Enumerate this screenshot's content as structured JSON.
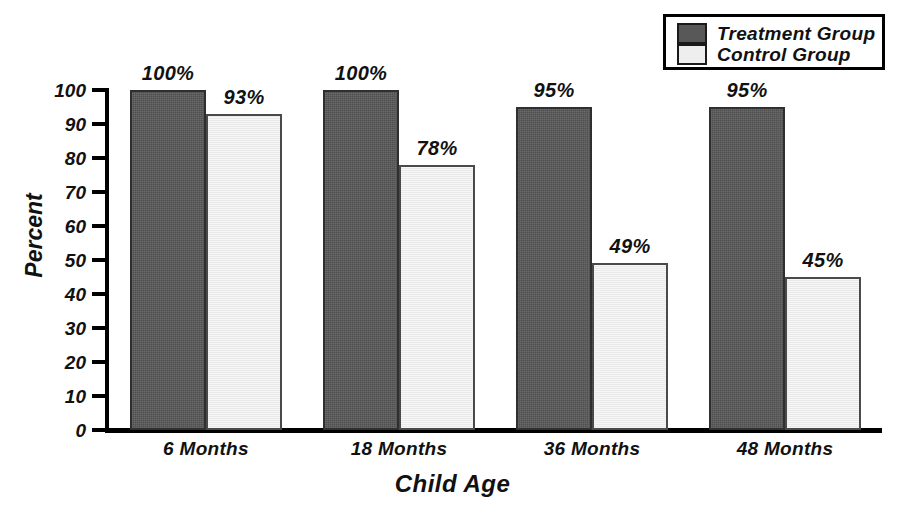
{
  "chart_data": {
    "type": "bar",
    "title": "",
    "xlabel": "Child Age",
    "ylabel": "Percent",
    "categories": [
      "6 Months",
      "18 Months",
      "36 Months",
      "48 Months"
    ],
    "series": [
      {
        "name": "Treatment Group",
        "values": [
          100,
          100,
          95,
          95
        ],
        "color": "#585858"
      },
      {
        "name": "Control Group",
        "values": [
          93,
          78,
          49,
          45
        ],
        "color": "#eeeeee"
      }
    ],
    "value_labels": [
      [
        "100%",
        "100%",
        "95%",
        "95%"
      ],
      [
        "93%",
        "78%",
        "49%",
        "45%"
      ]
    ],
    "ylim": [
      0,
      100
    ],
    "y_ticks": [
      0,
      10,
      20,
      30,
      40,
      50,
      60,
      70,
      80,
      90,
      100
    ],
    "y_tick_labels": [
      "0",
      "10",
      "20",
      "30",
      "40",
      "50",
      "60",
      "70",
      "80",
      "90",
      "100"
    ],
    "grid": false,
    "legend_position": "top-right"
  },
  "legend": {
    "entries": [
      {
        "label": "Treatment Group",
        "swatch": "#585858"
      },
      {
        "label": "Control Group",
        "swatch": "#eeeeee"
      }
    ]
  },
  "axes": {
    "y_title": "Percent",
    "x_title": "Child Age"
  }
}
